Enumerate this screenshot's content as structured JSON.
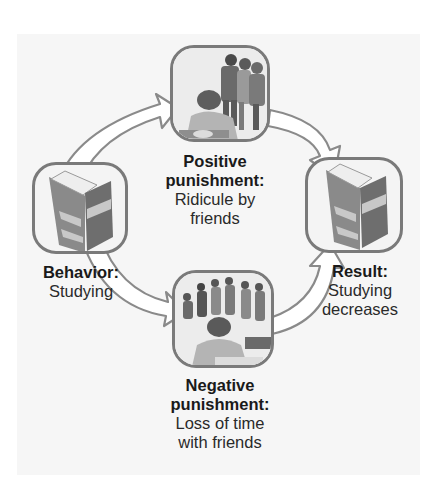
{
  "diagram": {
    "type": "operant-conditioning-punishment-cycle",
    "colors": {
      "background": "#ffffff",
      "panel": "#f6f6f6",
      "box_border": "#7a7a7a",
      "arrow_fill": "#ffffff",
      "arrow_stroke": "#8a8a8a",
      "book_cover": "#6e6e6e",
      "book_band": "#c8c8c8",
      "text": "#1a1a1a"
    },
    "nodes": {
      "behavior": {
        "title": "Behavior:",
        "lines": [
          "Studying"
        ],
        "icon": "book-icon"
      },
      "positive": {
        "title_lines": [
          "Positive",
          "punishment:"
        ],
        "lines": [
          "Ridicule by",
          "friends"
        ],
        "icon": "student-ridiculed-by-friends-illustration"
      },
      "negative": {
        "title_lines": [
          "Negative",
          "punishment:"
        ],
        "lines": [
          "Loss of time",
          "with friends"
        ],
        "icon": "student-studying-while-friends-socialize-illustration"
      },
      "result": {
        "title": "Result:",
        "lines": [
          "Studying",
          "decreases"
        ],
        "icon": "book-icon"
      }
    },
    "edges": [
      {
        "from": "behavior",
        "to": "positive"
      },
      {
        "from": "positive",
        "to": "result"
      },
      {
        "from": "behavior",
        "to": "negative"
      },
      {
        "from": "negative",
        "to": "result"
      }
    ]
  }
}
